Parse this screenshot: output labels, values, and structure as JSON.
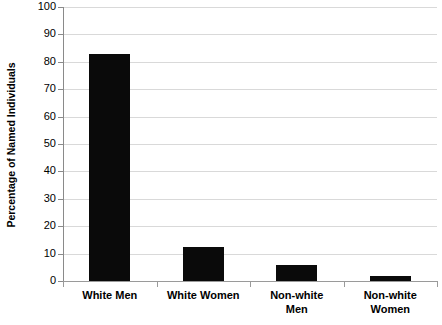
{
  "chart_data": {
    "type": "bar",
    "title": "",
    "xlabel": "",
    "ylabel": "Percentage of Named Individuals",
    "categories": [
      "White Men",
      "White Women",
      "Non-white Men",
      "Non-white Women"
    ],
    "category_lines": [
      [
        "White Men"
      ],
      [
        "White Women"
      ],
      [
        "Non-white",
        "Men"
      ],
      [
        "Non-white",
        "Women"
      ]
    ],
    "values": [
      83,
      12.5,
      5.8,
      1.8
    ],
    "ylim": [
      0,
      100
    ],
    "ytick_values": [
      0,
      10,
      20,
      30,
      40,
      50,
      60,
      70,
      80,
      90,
      100
    ],
    "ytick_labels": [
      "0",
      "10",
      "20",
      "30",
      "40",
      "50",
      "60",
      "70",
      "80",
      "90",
      "100"
    ],
    "grid": true,
    "legend": false,
    "bar_color": "#0a0a0a",
    "gridline_color": "#d9d9d9",
    "axis_color": "#8a8a8a",
    "background_color": "#ffffff"
  }
}
